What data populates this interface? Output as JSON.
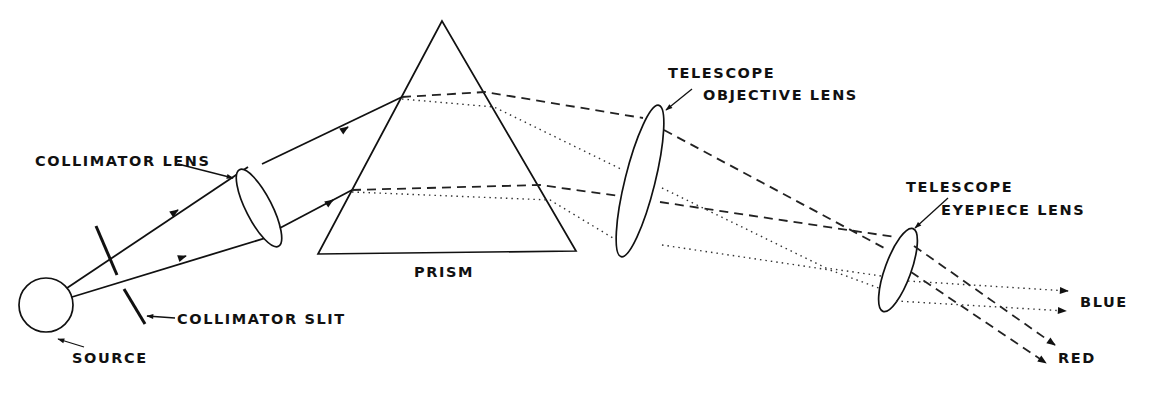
{
  "figure": {
    "type": "optical-schematic",
    "labels": {
      "collimator_lens": "COLLIMATOR LENS",
      "collimator_slit": "COLLIMATOR SLIT",
      "source": "SOURCE",
      "prism": "PRISM",
      "objective_line1": "TELESCOPE",
      "objective_line2": "OBJECTIVE LENS",
      "eyepiece_line1": "TELESCOPE",
      "eyepiece_line2": "EYEPIECE LENS",
      "blue": "BLUE",
      "red": "RED"
    },
    "legend_styles": {
      "blue_ray": "dotted",
      "red_ray": "dashed",
      "white_light": "solid"
    },
    "components": [
      {
        "name": "source",
        "shape": "circle"
      },
      {
        "name": "collimator slit",
        "shape": "split line"
      },
      {
        "name": "collimator lens",
        "shape": "ellipse"
      },
      {
        "name": "prism",
        "shape": "triangle"
      },
      {
        "name": "telescope objective lens",
        "shape": "ellipse"
      },
      {
        "name": "telescope eyepiece lens",
        "shape": "ellipse"
      }
    ],
    "colors": {
      "ink": "#111111",
      "background": "#ffffff"
    }
  },
  "caption": {
    "visible": "partially clipped at bottom edge (illegible)",
    "text": ""
  }
}
